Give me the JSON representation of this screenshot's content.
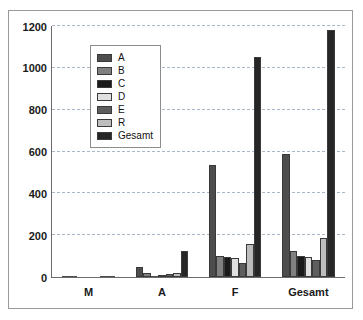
{
  "chart_data": {
    "type": "bar",
    "title": "",
    "subtitle": "",
    "xlabel": "",
    "ylabel": "",
    "categories": [
      "M",
      "A",
      "F",
      "Gesamt"
    ],
    "ylim": [
      0,
      1200
    ],
    "yticks": [
      0,
      200,
      400,
      600,
      800,
      1000,
      1200
    ],
    "ytick_labels": [
      "0",
      "200",
      "400",
      "600",
      "800",
      "1000",
      "1200"
    ],
    "grid": true,
    "grid_axis": "y",
    "legend_position": "upper-left-inside",
    "series": [
      {
        "name": "A",
        "color": "#4d4d4d",
        "values": [
          1,
          50,
          535,
          588
        ]
      },
      {
        "name": "B",
        "color": "#808080",
        "values": [
          1,
          20,
          100,
          122
        ]
      },
      {
        "name": "C",
        "color": "#1a1a1a",
        "values": [
          0,
          5,
          95,
          100
        ]
      },
      {
        "name": "D",
        "color": "#e0e0e0",
        "values": [
          0,
          10,
          90,
          98
        ]
      },
      {
        "name": "E",
        "color": "#5e5e5e",
        "values": [
          0,
          15,
          65,
          82
        ]
      },
      {
        "name": "R",
        "color": "#bdbdbd",
        "values": [
          1,
          20,
          160,
          185
        ]
      },
      {
        "name": "Gesamt",
        "color": "#262626",
        "values": [
          3,
          125,
          1050,
          1180
        ]
      }
    ]
  }
}
